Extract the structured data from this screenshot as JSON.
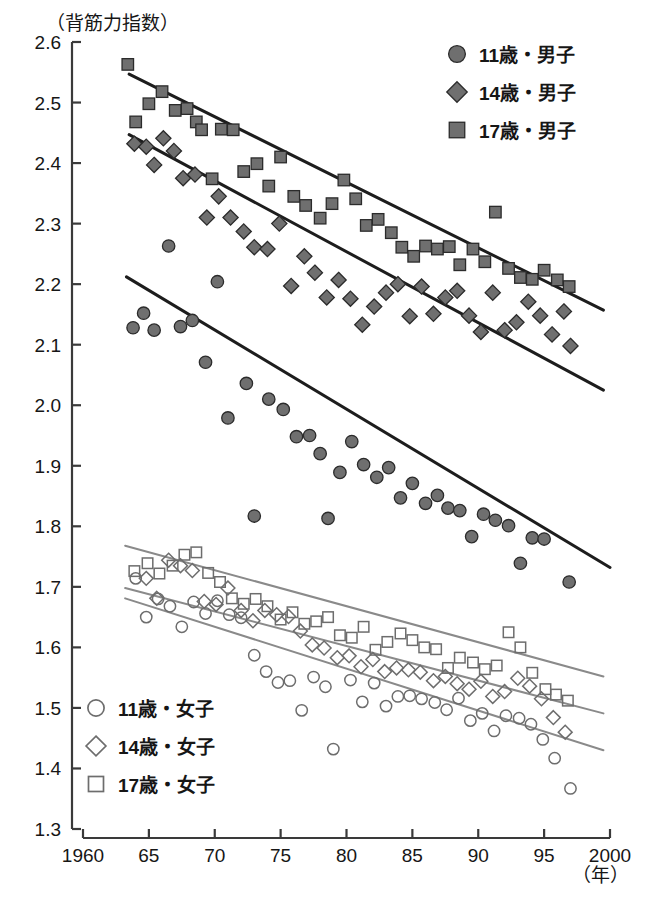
{
  "chart_data": {
    "type": "scatter",
    "title": "",
    "ylabel": "（背筋力指数）",
    "xlabel": "（年）",
    "xlim": [
      1960,
      2000
    ],
    "ylim": [
      1.3,
      2.6
    ],
    "grid": false,
    "legend_position": "top-right and bottom-left",
    "x_ticks": [
      "1960",
      "65",
      "70",
      "75",
      "80",
      "85",
      "90",
      "95",
      "2000"
    ],
    "x_tick_values": [
      1960,
      1965,
      1970,
      1975,
      1980,
      1985,
      1990,
      1995,
      2000
    ],
    "y_ticks": [
      "2.6",
      "2.5",
      "2.4",
      "2.3",
      "2.2",
      "2.1",
      "2.0",
      "1.9",
      "1.8",
      "1.7",
      "1.6",
      "1.5",
      "1.4",
      "1.3"
    ],
    "y_tick_values": [
      2.6,
      2.5,
      2.4,
      2.3,
      2.2,
      2.1,
      2.0,
      1.9,
      1.8,
      1.7,
      1.6,
      1.5,
      1.4,
      1.3
    ],
    "series": [
      {
        "name": "17歳・男子",
        "marker": "square",
        "fill": "#6f6f6f",
        "edge": "#2b2b2b",
        "hollow": false,
        "trend": {
          "x0": 1963.5,
          "y0": 2.547,
          "x1": 1999.5,
          "y1": 2.157,
          "color": "#1d1d1d"
        },
        "points": [
          [
            1963.4,
            2.563
          ],
          [
            1964.0,
            2.468
          ],
          [
            1965.0,
            2.498
          ],
          [
            1966.0,
            2.518
          ],
          [
            1967.0,
            2.487
          ],
          [
            1967.9,
            2.49
          ],
          [
            1968.6,
            2.468
          ],
          [
            1969.0,
            2.455
          ],
          [
            1969.8,
            2.374
          ],
          [
            1970.5,
            2.456
          ],
          [
            1971.4,
            2.455
          ],
          [
            1972.2,
            2.386
          ],
          [
            1973.2,
            2.399
          ],
          [
            1974.1,
            2.362
          ],
          [
            1975.0,
            2.41
          ],
          [
            1976.0,
            2.345
          ],
          [
            1976.9,
            2.33
          ],
          [
            1978.0,
            2.309
          ],
          [
            1978.9,
            2.333
          ],
          [
            1979.8,
            2.372
          ],
          [
            1980.7,
            2.341
          ],
          [
            1981.5,
            2.297
          ],
          [
            1982.4,
            2.307
          ],
          [
            1983.4,
            2.285
          ],
          [
            1984.2,
            2.261
          ],
          [
            1985.1,
            2.246
          ],
          [
            1986.0,
            2.263
          ],
          [
            1986.9,
            2.258
          ],
          [
            1987.8,
            2.262
          ],
          [
            1988.6,
            2.232
          ],
          [
            1989.6,
            2.258
          ],
          [
            1990.5,
            2.237
          ],
          [
            1991.3,
            2.319
          ],
          [
            1992.3,
            2.226
          ],
          [
            1993.2,
            2.211
          ],
          [
            1994.1,
            2.208
          ],
          [
            1995.0,
            2.223
          ],
          [
            1996.0,
            2.207
          ],
          [
            1996.9,
            2.196
          ]
        ]
      },
      {
        "name": "14歳・男子",
        "marker": "diamond",
        "fill": "#6f6f6f",
        "edge": "#2b2b2b",
        "hollow": false,
        "trend": {
          "x0": 1963.5,
          "y0": 2.447,
          "x1": 1999.5,
          "y1": 2.025,
          "color": "#1d1d1d"
        },
        "points": [
          [
            1963.9,
            2.432
          ],
          [
            1964.8,
            2.427
          ],
          [
            1965.4,
            2.397
          ],
          [
            1966.1,
            2.441
          ],
          [
            1966.9,
            2.42
          ],
          [
            1967.6,
            2.375
          ],
          [
            1968.5,
            2.381
          ],
          [
            1969.4,
            2.31
          ],
          [
            1970.3,
            2.345
          ],
          [
            1971.2,
            2.31
          ],
          [
            1972.2,
            2.287
          ],
          [
            1973.0,
            2.261
          ],
          [
            1974.0,
            2.258
          ],
          [
            1974.9,
            2.3
          ],
          [
            1975.8,
            2.197
          ],
          [
            1976.8,
            2.246
          ],
          [
            1977.6,
            2.219
          ],
          [
            1978.5,
            2.178
          ],
          [
            1979.4,
            2.207
          ],
          [
            1980.3,
            2.176
          ],
          [
            1981.2,
            2.133
          ],
          [
            1982.1,
            2.163
          ],
          [
            1983.0,
            2.186
          ],
          [
            1983.9,
            2.2
          ],
          [
            1984.8,
            2.147
          ],
          [
            1985.7,
            2.196
          ],
          [
            1986.6,
            2.151
          ],
          [
            1987.5,
            2.178
          ],
          [
            1988.4,
            2.189
          ],
          [
            1989.3,
            2.148
          ],
          [
            1990.2,
            2.121
          ],
          [
            1991.1,
            2.186
          ],
          [
            1992.0,
            2.124
          ],
          [
            1992.9,
            2.137
          ],
          [
            1993.8,
            2.171
          ],
          [
            1994.7,
            2.148
          ],
          [
            1995.6,
            2.117
          ],
          [
            1996.5,
            2.155
          ],
          [
            1997.0,
            2.098
          ]
        ]
      },
      {
        "name": "11歳・男子",
        "marker": "circle",
        "fill": "#6f6f6f",
        "edge": "#2b2b2b",
        "hollow": false,
        "trend": {
          "x0": 1963.3,
          "y0": 2.212,
          "x1": 2000.0,
          "y1": 1.732,
          "color": "#1d1d1d"
        },
        "points": [
          [
            1963.8,
            2.128
          ],
          [
            1964.6,
            2.152
          ],
          [
            1965.4,
            2.124
          ],
          [
            1966.5,
            2.263
          ],
          [
            1967.4,
            2.13
          ],
          [
            1968.3,
            2.14
          ],
          [
            1969.3,
            2.071
          ],
          [
            1970.2,
            2.204
          ],
          [
            1971.0,
            1.979
          ],
          [
            1972.4,
            2.036
          ],
          [
            1973.0,
            1.817
          ],
          [
            1974.1,
            2.01
          ],
          [
            1975.2,
            1.993
          ],
          [
            1976.2,
            1.948
          ],
          [
            1977.2,
            1.95
          ],
          [
            1978.0,
            1.92
          ],
          [
            1978.6,
            1.813
          ],
          [
            1979.5,
            1.889
          ],
          [
            1980.4,
            1.94
          ],
          [
            1981.3,
            1.902
          ],
          [
            1982.3,
            1.881
          ],
          [
            1983.2,
            1.897
          ],
          [
            1984.1,
            1.847
          ],
          [
            1985.0,
            1.871
          ],
          [
            1986.0,
            1.838
          ],
          [
            1986.9,
            1.851
          ],
          [
            1987.7,
            1.83
          ],
          [
            1988.6,
            1.826
          ],
          [
            1989.5,
            1.783
          ],
          [
            1990.4,
            1.82
          ],
          [
            1991.3,
            1.81
          ],
          [
            1992.3,
            1.801
          ],
          [
            1993.2,
            1.739
          ],
          [
            1994.1,
            1.781
          ],
          [
            1995.0,
            1.779
          ],
          [
            1996.9,
            1.708
          ]
        ]
      },
      {
        "name": "17歳・女子",
        "marker": "square",
        "fill": "none",
        "edge": "#6d6d6d",
        "hollow": true,
        "trend": {
          "x0": 1963.2,
          "y0": 1.768,
          "x1": 1999.5,
          "y1": 1.552,
          "color": "#8a8a8a"
        },
        "points": [
          [
            1963.9,
            1.726
          ],
          [
            1964.9,
            1.739
          ],
          [
            1965.8,
            1.722
          ],
          [
            1966.8,
            1.735
          ],
          [
            1967.7,
            1.753
          ],
          [
            1968.6,
            1.757
          ],
          [
            1969.5,
            1.723
          ],
          [
            1970.4,
            1.708
          ],
          [
            1971.3,
            1.681
          ],
          [
            1972.2,
            1.672
          ],
          [
            1973.1,
            1.68
          ],
          [
            1974.0,
            1.668
          ],
          [
            1975.0,
            1.646
          ],
          [
            1975.9,
            1.658
          ],
          [
            1976.8,
            1.639
          ],
          [
            1977.7,
            1.643
          ],
          [
            1978.6,
            1.65
          ],
          [
            1979.5,
            1.62
          ],
          [
            1980.4,
            1.616
          ],
          [
            1981.3,
            1.634
          ],
          [
            1982.2,
            1.596
          ],
          [
            1983.1,
            1.609
          ],
          [
            1984.1,
            1.623
          ],
          [
            1985.0,
            1.612
          ],
          [
            1985.9,
            1.6
          ],
          [
            1986.8,
            1.597
          ],
          [
            1987.7,
            1.566
          ],
          [
            1988.6,
            1.583
          ],
          [
            1989.6,
            1.575
          ],
          [
            1990.5,
            1.564
          ],
          [
            1991.4,
            1.57
          ],
          [
            1992.3,
            1.625
          ],
          [
            1993.2,
            1.6
          ],
          [
            1994.1,
            1.558
          ],
          [
            1995.1,
            1.531
          ],
          [
            1995.9,
            1.522
          ],
          [
            1996.8,
            1.512
          ]
        ]
      },
      {
        "name": "14歳・女子",
        "marker": "diamond",
        "fill": "none",
        "edge": "#6d6d6d",
        "hollow": true,
        "trend": {
          "x0": 1963.2,
          "y0": 1.698,
          "x1": 1999.5,
          "y1": 1.491,
          "color": "#8a8a8a"
        },
        "points": [
          [
            1964.8,
            1.714
          ],
          [
            1965.6,
            1.681
          ],
          [
            1966.5,
            1.744
          ],
          [
            1967.4,
            1.735
          ],
          [
            1968.3,
            1.727
          ],
          [
            1969.2,
            1.676
          ],
          [
            1970.1,
            1.671
          ],
          [
            1971.0,
            1.698
          ],
          [
            1972.0,
            1.661
          ],
          [
            1972.9,
            1.644
          ],
          [
            1973.8,
            1.661
          ],
          [
            1974.7,
            1.654
          ],
          [
            1975.6,
            1.651
          ],
          [
            1976.5,
            1.627
          ],
          [
            1977.4,
            1.604
          ],
          [
            1978.3,
            1.599
          ],
          [
            1979.3,
            1.583
          ],
          [
            1980.2,
            1.586
          ],
          [
            1981.1,
            1.568
          ],
          [
            1982.0,
            1.58
          ],
          [
            1982.9,
            1.56
          ],
          [
            1983.8,
            1.566
          ],
          [
            1984.7,
            1.563
          ],
          [
            1985.6,
            1.559
          ],
          [
            1986.6,
            1.545
          ],
          [
            1987.5,
            1.552
          ],
          [
            1988.4,
            1.54
          ],
          [
            1989.3,
            1.531
          ],
          [
            1990.2,
            1.544
          ],
          [
            1991.1,
            1.519
          ],
          [
            1992.0,
            1.527
          ],
          [
            1993.0,
            1.549
          ],
          [
            1993.9,
            1.536
          ],
          [
            1994.8,
            1.515
          ],
          [
            1995.7,
            1.484
          ],
          [
            1996.6,
            1.46
          ]
        ]
      },
      {
        "name": "11歳・女子",
        "marker": "circle",
        "fill": "none",
        "edge": "#6d6d6d",
        "hollow": true,
        "trend": {
          "x0": 1963.2,
          "y0": 1.681,
          "x1": 1999.5,
          "y1": 1.43,
          "color": "#8a8a8a"
        },
        "points": [
          [
            1964.0,
            1.714
          ],
          [
            1964.8,
            1.65
          ],
          [
            1965.7,
            1.68
          ],
          [
            1966.6,
            1.668
          ],
          [
            1967.5,
            1.634
          ],
          [
            1968.4,
            1.675
          ],
          [
            1969.3,
            1.656
          ],
          [
            1970.2,
            1.677
          ],
          [
            1971.1,
            1.654
          ],
          [
            1972.0,
            1.649
          ],
          [
            1973.0,
            1.587
          ],
          [
            1973.9,
            1.56
          ],
          [
            1974.8,
            1.542
          ],
          [
            1975.7,
            1.545
          ],
          [
            1976.6,
            1.496
          ],
          [
            1977.5,
            1.551
          ],
          [
            1978.4,
            1.535
          ],
          [
            1979.0,
            1.432
          ],
          [
            1980.3,
            1.546
          ],
          [
            1981.2,
            1.51
          ],
          [
            1982.1,
            1.541
          ],
          [
            1983.0,
            1.503
          ],
          [
            1983.9,
            1.519
          ],
          [
            1984.8,
            1.52
          ],
          [
            1985.7,
            1.515
          ],
          [
            1986.7,
            1.509
          ],
          [
            1987.6,
            1.497
          ],
          [
            1988.5,
            1.516
          ],
          [
            1989.4,
            1.479
          ],
          [
            1990.3,
            1.491
          ],
          [
            1991.2,
            1.462
          ],
          [
            1992.1,
            1.487
          ],
          [
            1993.1,
            1.483
          ],
          [
            1994.0,
            1.473
          ],
          [
            1994.9,
            1.448
          ],
          [
            1995.8,
            1.417
          ],
          [
            1997.0,
            1.367
          ]
        ]
      }
    ]
  },
  "axes": {
    "y_title": "（背筋力指数）",
    "x_unit": "（年）"
  },
  "legend_male": {
    "title": "",
    "items": [
      {
        "label": "11歳・男子",
        "marker": "circle"
      },
      {
        "label": "14歳・男子",
        "marker": "diamond"
      },
      {
        "label": "17歳・男子",
        "marker": "square"
      }
    ]
  },
  "legend_female": {
    "title": "",
    "items": [
      {
        "label": "11歳・女子",
        "marker": "circle-hollow"
      },
      {
        "label": "14歳・女子",
        "marker": "diamond-hollow"
      },
      {
        "label": "17歳・女子",
        "marker": "square-hollow"
      }
    ]
  },
  "colors": {
    "marker_fill": "#6f6f6f",
    "marker_edge": "#2b2b2b",
    "hollow_edge": "#6d6d6d",
    "trend_male": "#1d1d1d",
    "trend_female": "#8a8a8a",
    "axis": "#3a3a3a",
    "background": "#ffffff"
  }
}
